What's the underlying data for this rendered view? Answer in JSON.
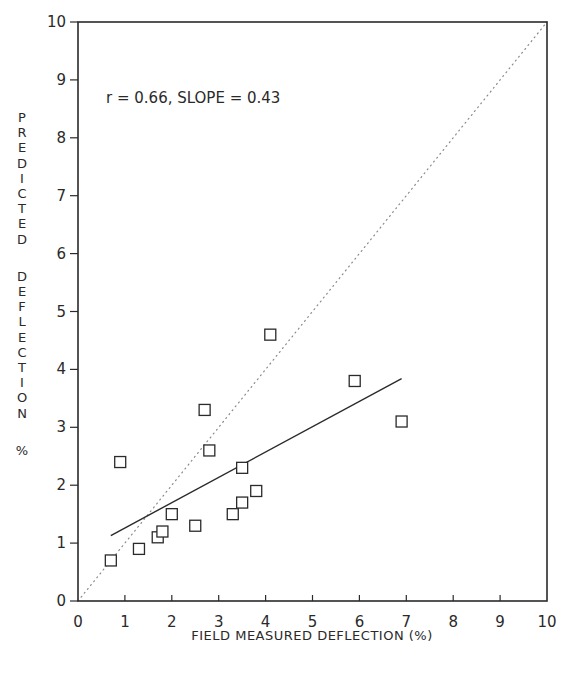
{
  "chart_data": {
    "type": "scatter",
    "title": "",
    "xlabel": "FIELD MEASURED DEFLECTION (%)",
    "ylabel": "PREDICTED DEFLECTION %",
    "xlim": [
      0,
      10
    ],
    "ylim": [
      0,
      10
    ],
    "xticks": [
      0,
      1,
      2,
      3,
      4,
      5,
      6,
      7,
      8,
      9,
      10
    ],
    "yticks": [
      0,
      1,
      2,
      3,
      4,
      5,
      6,
      7,
      8,
      9,
      10
    ],
    "grid": false,
    "annotation": "r = 0.66, SLOPE = 0.43",
    "series": [
      {
        "name": "data",
        "marker": "open-square",
        "points": [
          {
            "x": 0.7,
            "y": 0.7
          },
          {
            "x": 1.3,
            "y": 0.9
          },
          {
            "x": 1.7,
            "y": 1.1
          },
          {
            "x": 1.8,
            "y": 1.2
          },
          {
            "x": 2.0,
            "y": 1.5
          },
          {
            "x": 2.5,
            "y": 1.3
          },
          {
            "x": 3.3,
            "y": 1.5
          },
          {
            "x": 3.5,
            "y": 1.7
          },
          {
            "x": 3.8,
            "y": 1.9
          },
          {
            "x": 3.5,
            "y": 2.3
          },
          {
            "x": 0.9,
            "y": 2.4
          },
          {
            "x": 2.8,
            "y": 2.6
          },
          {
            "x": 2.7,
            "y": 3.3
          },
          {
            "x": 4.1,
            "y": 4.6
          },
          {
            "x": 5.9,
            "y": 3.8
          },
          {
            "x": 6.9,
            "y": 3.1
          }
        ]
      }
    ],
    "lines": [
      {
        "name": "regression",
        "style": "solid",
        "x": [
          0.7,
          6.9
        ],
        "y": [
          1.13,
          3.84
        ]
      },
      {
        "name": "line-of-equality",
        "style": "dotted",
        "x": [
          0,
          10
        ],
        "y": [
          0,
          10
        ]
      }
    ]
  },
  "colors": {
    "ink": "#2a2a2a",
    "dotted": "#8a8a8a",
    "background": "#ffffff"
  }
}
